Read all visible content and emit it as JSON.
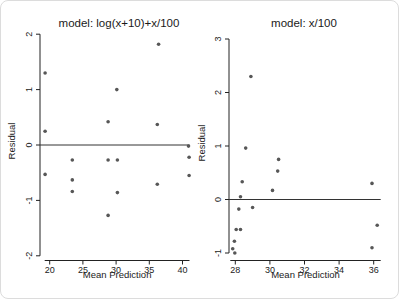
{
  "figure": {
    "background": "#ffffff",
    "border_color": "#dcdcdc",
    "axis_color": "#222222",
    "text_color": "#222222",
    "point_color": "#575757"
  },
  "chart_data": [
    {
      "type": "scatter",
      "title": "model: log(x+10)+x/100",
      "xlabel": "Mean Prediction",
      "ylabel": "Residual",
      "xticks": [
        20,
        25,
        30,
        35,
        40
      ],
      "yticks": [
        -2,
        -1,
        0,
        1,
        2
      ],
      "xlim": [
        18.5,
        41.5
      ],
      "ylim": [
        -2.1,
        2.1
      ],
      "refline_y": 0,
      "grid": false,
      "legend": null,
      "points": [
        [
          19.3,
          1.3
        ],
        [
          19.3,
          0.25
        ],
        [
          19.3,
          -0.53
        ],
        [
          23.4,
          -0.27
        ],
        [
          23.4,
          -0.63
        ],
        [
          23.4,
          -0.84
        ],
        [
          28.8,
          0.42
        ],
        [
          28.8,
          -0.27
        ],
        [
          28.8,
          -1.27
        ],
        [
          30.1,
          1.0
        ],
        [
          30.2,
          -0.27
        ],
        [
          30.2,
          -0.86
        ],
        [
          36.4,
          1.82
        ],
        [
          36.2,
          0.37
        ],
        [
          36.2,
          -0.71
        ],
        [
          40.9,
          -0.02
        ],
        [
          41.0,
          -0.22
        ],
        [
          41.0,
          -0.55
        ]
      ]
    },
    {
      "type": "scatter",
      "title": "model: x/100",
      "xlabel": "Mean Prediction",
      "ylabel": "Residual",
      "xticks": [
        28,
        30,
        32,
        34,
        36
      ],
      "yticks": [
        -1,
        0,
        1,
        2,
        3
      ],
      "xlim": [
        27.6,
        36.8
      ],
      "ylim": [
        -1.15,
        3.1
      ],
      "refline_y": 0,
      "grid": false,
      "legend": null,
      "points": [
        [
          28.9,
          2.3
        ],
        [
          28.6,
          0.96
        ],
        [
          28.4,
          0.33
        ],
        [
          28.3,
          0.05
        ],
        [
          28.2,
          -0.18
        ],
        [
          28.05,
          -0.56
        ],
        [
          28.3,
          -0.56
        ],
        [
          27.95,
          -0.78
        ],
        [
          27.85,
          -0.92
        ],
        [
          27.97,
          -1.0
        ],
        [
          29.0,
          -0.15
        ],
        [
          30.15,
          0.17
        ],
        [
          30.45,
          0.53
        ],
        [
          30.5,
          0.75
        ],
        [
          35.9,
          0.3
        ],
        [
          36.2,
          -0.48
        ],
        [
          35.9,
          -0.9
        ]
      ]
    }
  ]
}
